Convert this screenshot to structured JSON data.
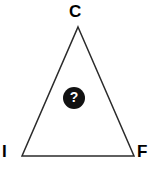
{
  "figure": {
    "type": "triangle-diagram",
    "background_color": "#ffffff",
    "stroke_color": "#2b2b2b",
    "stroke_width": 1.5,
    "width": 156,
    "height": 171,
    "vertices": [
      {
        "id": "apex",
        "label": "C",
        "x": 78,
        "y": 27
      },
      {
        "id": "bottom-left",
        "label": "I",
        "x": 22,
        "y": 156
      },
      {
        "id": "bottom-right",
        "label": "F",
        "x": 134,
        "y": 156
      }
    ],
    "labels": {
      "apex": "C",
      "bottom_left": "I",
      "bottom_right": "F"
    },
    "marker": {
      "name": "question-mark-badge",
      "glyph": "?",
      "fill_color": "#111111",
      "text_color": "#ffffff",
      "center_x": 74,
      "center_y": 98,
      "diameter": 22
    }
  }
}
